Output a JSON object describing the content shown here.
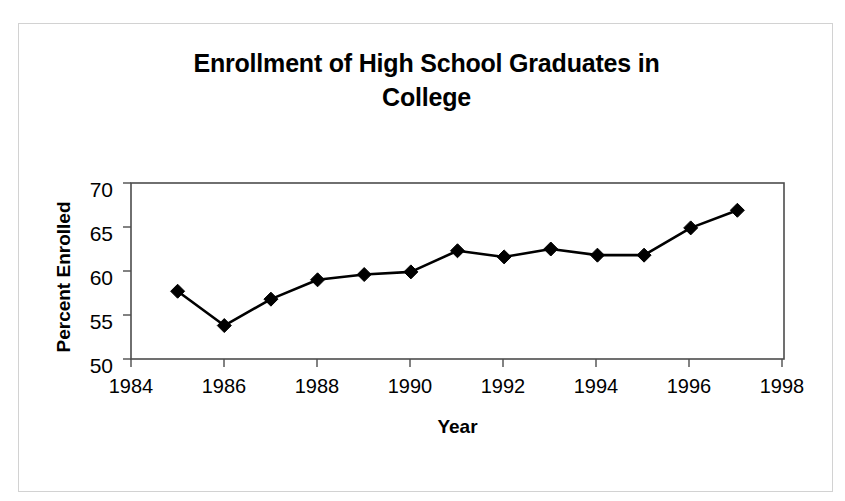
{
  "chart_data": {
    "type": "line",
    "title": "Enrollment of High School Graduates in College",
    "title_line1": "Enrollment of High School Graduates in",
    "title_line2": "College",
    "xlabel": "Year",
    "ylabel": "Percent Enrolled",
    "x": [
      1985,
      1986,
      1987,
      1988,
      1989,
      1990,
      1991,
      1992,
      1993,
      1994,
      1995,
      1996,
      1997
    ],
    "values": [
      57.7,
      53.8,
      56.8,
      59.0,
      59.6,
      59.9,
      62.3,
      61.6,
      62.5,
      61.8,
      61.8,
      64.9,
      66.9
    ],
    "series": [
      {
        "name": "Percent Enrolled",
        "values": [
          57.7,
          53.8,
          56.8,
          59.0,
          59.6,
          59.9,
          62.3,
          61.6,
          62.5,
          61.8,
          61.8,
          64.9,
          66.9
        ]
      }
    ],
    "xlim": [
      1984,
      1998
    ],
    "ylim": [
      50,
      70
    ],
    "xticks": [
      1984,
      1986,
      1988,
      1990,
      1992,
      1994,
      1996,
      1998
    ],
    "yticks": [
      50,
      55,
      60,
      65,
      70
    ],
    "xtick_labels": [
      "1984",
      "1986",
      "1988",
      "1990",
      "1992",
      "1994",
      "1996",
      "1998"
    ],
    "ytick_labels": [
      "50",
      "55",
      "60",
      "65",
      "70"
    ],
    "grid": false,
    "legend": false,
    "marker": "diamond",
    "line_color": "#000000",
    "marker_color": "#000000",
    "plot_border_color": "#4d4d4d",
    "card_border_color": "#d2d2d2",
    "background_color": "#ffffff"
  }
}
